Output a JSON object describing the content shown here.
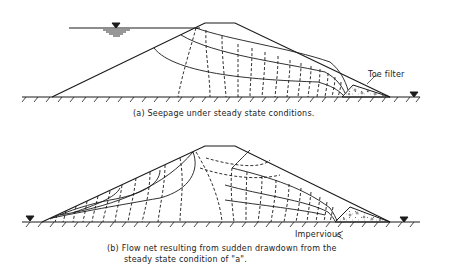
{
  "figure": {
    "panel_a": {
      "caption": "(a) Seepage under steady state conditions.",
      "label_toe_filter": "Toe filter"
    },
    "panel_b": {
      "caption_line1": "(b) Flow net resulting from sudden drawdown from the",
      "caption_line2": "steady state condition of \"a\".",
      "label_impervious": "Impervious"
    },
    "symbols": {
      "water_level": "water-level-triangle",
      "ground": "hatched-ground-line",
      "filter": "stippled-toe-filter"
    },
    "colors": {
      "ink": "#1a1a1a",
      "background": "#ffffff"
    }
  }
}
